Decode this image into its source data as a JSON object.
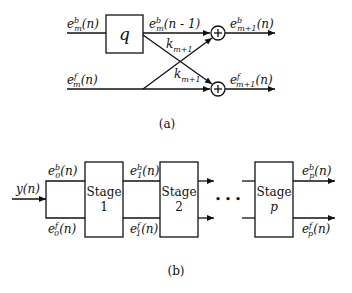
{
  "diagram_a": {
    "caption": "(a)",
    "delay_block": "q",
    "input_top": {
      "base": "e",
      "sup": "b",
      "sub": "m",
      "arg": "(n)"
    },
    "input_bottom": {
      "base": "e",
      "sup": "f",
      "sub": "m",
      "arg": "(n)"
    },
    "delayed": {
      "base": "e",
      "sup": "b",
      "sub": "m",
      "arg": "(n - 1)"
    },
    "coef_top": {
      "base": "k",
      "sub": "m+1"
    },
    "coef_bottom": {
      "base": "k",
      "sub": "m+1"
    },
    "output_top": {
      "base": "e",
      "sup": "b",
      "sub": "m+1",
      "arg": "(n)"
    },
    "output_bottom": {
      "base": "e",
      "sup": "f",
      "sub": "m+1",
      "arg": "(n)"
    },
    "adder_symbol": "+"
  },
  "diagram_b": {
    "caption": "(b)",
    "input": "y(n)",
    "e0b": {
      "base": "e",
      "sup": "b",
      "sub": "0",
      "arg": "(n)"
    },
    "e0f": {
      "base": "e",
      "sup": "f",
      "sub": "0",
      "arg": "(n)"
    },
    "e1b": {
      "base": "e",
      "sup": "b",
      "sub": "1",
      "arg": "(n)"
    },
    "e1f": {
      "base": "e",
      "sup": "f",
      "sub": "1",
      "arg": "(n)"
    },
    "epb": {
      "base": "e",
      "sup": "b",
      "sub": "p",
      "arg": "(n)"
    },
    "epf": {
      "base": "e",
      "sup": "f",
      "sub": "p",
      "arg": "(n)"
    },
    "stages": [
      {
        "title": "Stage",
        "index": "1"
      },
      {
        "title": "Stage",
        "index": "2"
      },
      {
        "title": "Stage",
        "index": "p"
      }
    ],
    "ellipsis": "• • •"
  }
}
